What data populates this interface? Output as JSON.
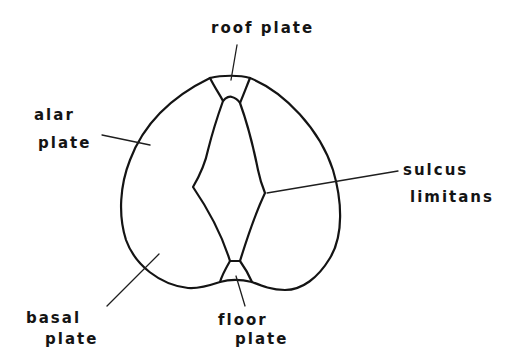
{
  "diagram": {
    "colors": {
      "background": "#ffffff",
      "line": "#141414",
      "text": "#141414"
    },
    "labels": {
      "roof_plate": "roof plate",
      "alar_plate_line1": "alar",
      "alar_plate_line2": "plate",
      "sulcus_limitans_line1": "sulcus",
      "sulcus_limitans_line2": "limitans",
      "basal_plate_line1": "basal",
      "basal_plate_line2": "plate",
      "floor_plate_line1": "floor",
      "floor_plate_line2": "plate"
    },
    "structures": [
      {
        "name": "roof plate",
        "position": "dorsal midline"
      },
      {
        "name": "alar plate",
        "position": "dorsolateral"
      },
      {
        "name": "sulcus limitans",
        "position": "lateral wall of central canal"
      },
      {
        "name": "basal plate",
        "position": "ventrolateral"
      },
      {
        "name": "floor plate",
        "position": "ventral midline"
      }
    ]
  }
}
